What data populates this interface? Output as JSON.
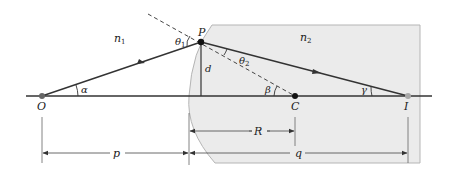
{
  "diagram": {
    "colors": {
      "medium2_fill": "#ebebeb",
      "medium2_edge": "#b5b5b5",
      "line": "#333333",
      "dashed": "#444444",
      "point_I": "#a8a8a8"
    },
    "media": {
      "n1": {
        "label": "n",
        "sub": "1"
      },
      "n2": {
        "label": "n",
        "sub": "2"
      }
    },
    "points": {
      "O": "O",
      "P": "P",
      "C": "C",
      "I": "I"
    },
    "angles": {
      "alpha": "α",
      "beta": "β",
      "gamma": "γ",
      "theta1": {
        "label": "θ",
        "sub": "1"
      },
      "theta2": {
        "label": "θ",
        "sub": "2"
      }
    },
    "lengths": {
      "d": "d",
      "p": "p",
      "q": "q",
      "R": "R"
    }
  }
}
